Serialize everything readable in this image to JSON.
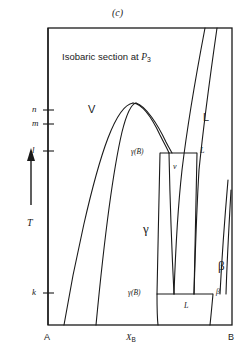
{
  "figure": {
    "caption": "(c)",
    "title_prefix": "Isobaric section at ",
    "title_symbol": "P",
    "title_sub": "3",
    "width": 245,
    "height": 361,
    "line_color": "#1a1a1a",
    "background": "#ffffff"
  },
  "axes": {
    "y_axis_label": "T",
    "y_axis_arrow": "up-arrow",
    "x_axis_label_symbol": "X",
    "x_axis_label_sub": "B",
    "left_corner_label": "A",
    "right_corner_label": "B",
    "y_ticks": [
      {
        "label": "n",
        "y": 110
      },
      {
        "label": "m",
        "y": 124
      },
      {
        "label": "l",
        "y": 151
      },
      {
        "label": "k",
        "y": 293
      }
    ],
    "frame": {
      "left": 48,
      "right": 232,
      "top": 28,
      "bottom": 325
    }
  },
  "regions": [
    {
      "name": "vapor",
      "label": "V",
      "x": 88,
      "y": 104,
      "style": "sans-large"
    },
    {
      "name": "liquid",
      "label": "L",
      "x": 203,
      "y": 112,
      "style": "sans-large"
    },
    {
      "name": "gamma-solid",
      "label": "γ",
      "x": 143,
      "y": 222,
      "style": "greek-large"
    },
    {
      "name": "beta-solid",
      "label": "β",
      "x": 218,
      "y": 259,
      "style": "greek-large"
    }
  ],
  "tie_lines": [
    {
      "name": "upper-tie-line",
      "y": 153,
      "x_start": 160,
      "x_end": 197,
      "left_label": "γ(B)",
      "left_label_x": 131,
      "right_label": "L",
      "right_label_x": 200,
      "below_label": "v",
      "below_label_x": 173,
      "below_label_y": 163
    },
    {
      "name": "lower-tie-line",
      "y": 294,
      "x_start": 157,
      "x_end": 213,
      "left_label": "γ(B)",
      "left_label_x": 128,
      "right_label": "β",
      "right_label_x": 216,
      "below_label": "L",
      "below_label_x": 184,
      "below_label_y": 302
    }
  ],
  "chart_data": {
    "type": "line",
    "title": "Isobaric section at P3",
    "subtitle": "(c)",
    "xlabel": "X_B",
    "ylabel": "T",
    "xlim": [
      0,
      1
    ],
    "ylim": [
      0,
      1
    ],
    "grid": false,
    "legend": null,
    "x_tick_labels": [
      "A",
      "B"
    ],
    "y_tick_labels": [
      "k",
      "l",
      "m",
      "n"
    ],
    "annotations": [
      "V",
      "L",
      "γ",
      "β",
      "γ(B)",
      "v",
      "L",
      "γ(B)",
      "L",
      "β"
    ],
    "series": [
      {
        "name": "vapor-dome-left-branch",
        "path": "M 64 325 C 74 265 92 180 108 138 C 118 112 126 104 133 103"
      },
      {
        "name": "vapor-dome-right-branch",
        "path": "M 133 103 C 142 104 152 118 160 135 C 165 145 168 150 169 153"
      },
      {
        "name": "inner-dome-left-branch",
        "path": "M 96 325 C 102 262 112 175 122 132 C 127 112 131 104 136 103"
      },
      {
        "name": "inner-dome-right-branch",
        "path": "M 136 103 C 146 106 158 125 166 142 C 169 148 171 151 172 153"
      },
      {
        "name": "gamma-right-boundary-upper",
        "path": "M 160 153 C 159 190 158 250 157 294"
      },
      {
        "name": "gamma-right-boundary-lower",
        "path": "M 157 294 C 157 305 157 316 158 325"
      },
      {
        "name": "vapor-pocket-left-edge",
        "path": "M 169 153 C 170 200 172 255 174 294"
      },
      {
        "name": "vapor-pocket-right-edge",
        "path": "M 197 153 C 196 200 195 250 194 294"
      },
      {
        "name": "liquid-left-boundary",
        "path": "M 205 28 C 197 70 188 120 182 170 C 177 215 175 265 174 294"
      },
      {
        "name": "liquid-right-boundary",
        "path": "M 217 28 C 211 70 204 120 199 170 C 196 220 195 265 194 294"
      },
      {
        "name": "beta-left-boundary",
        "path": "M 213 294 C 212 305 211 316 210 325"
      },
      {
        "name": "beta-right-boundary",
        "path": "M 228 180 C 225 215 222 255 220 294"
      },
      {
        "name": "beta-solidus-edge",
        "path": "M 231 190 C 229 225 227 260 226 294"
      }
    ]
  }
}
